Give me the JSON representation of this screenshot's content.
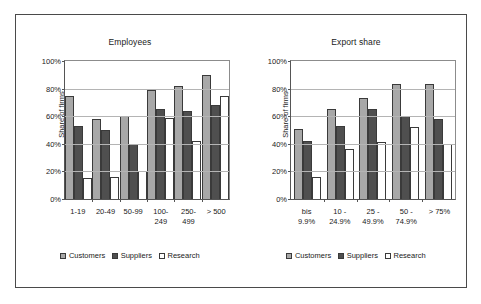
{
  "figure": {
    "ylabel": "Share of firms",
    "legend": [
      {
        "label": "Customers",
        "key": "customers"
      },
      {
        "label": "Suppliers",
        "key": "suppliers"
      },
      {
        "label": "Research",
        "key": "research"
      }
    ],
    "yticks": [
      "0%",
      "20%",
      "40%",
      "60%",
      "80%",
      "100%"
    ],
    "colors": {
      "customers": "#a8a8a8",
      "suppliers": "#4f4f4f",
      "research": "#ffffff",
      "outline": "#3a3a3a",
      "grid": "#b4b4b4",
      "frame": "#4a4a4a"
    }
  },
  "chart_data": [
    {
      "type": "bar",
      "title": "Employees",
      "xlabel": "",
      "ylabel": "Share of firms",
      "ylim": [
        0,
        100
      ],
      "yticks": [
        0,
        20,
        40,
        60,
        80,
        100
      ],
      "grid": true,
      "legend_position": "bottom",
      "categories": [
        "1-19",
        "20-49",
        "50-99",
        "100-249",
        "250-499",
        "> 500"
      ],
      "category_lines": [
        [
          "1-19"
        ],
        [
          "20-49"
        ],
        [
          "50-99"
        ],
        [
          "100-",
          "249"
        ],
        [
          "250-",
          "499"
        ],
        [
          "> 500"
        ]
      ],
      "series": [
        {
          "name": "Customers",
          "values": [
            75,
            58,
            60,
            79,
            82,
            90
          ]
        },
        {
          "name": "Suppliers",
          "values": [
            53,
            50,
            40,
            65,
            64,
            68
          ]
        },
        {
          "name": "Research",
          "values": [
            15,
            16,
            20,
            59,
            42,
            75
          ]
        }
      ]
    },
    {
      "type": "bar",
      "title": "Export share",
      "xlabel": "",
      "ylabel": "Share of firms",
      "ylim": [
        0,
        100
      ],
      "yticks": [
        0,
        20,
        40,
        60,
        80,
        100
      ],
      "grid": true,
      "legend_position": "bottom",
      "categories": [
        "bis 9.9%",
        "10 - 24.9%",
        "25 - 49.9%",
        "50 - 74.9%",
        "> 75%"
      ],
      "category_lines": [
        [
          "bis",
          "9.9%"
        ],
        [
          "10 -",
          "24.9%"
        ],
        [
          "25 -",
          "49.9%"
        ],
        [
          "50 -",
          "74.9%"
        ],
        [
          "> 75%"
        ]
      ],
      "series": [
        {
          "name": "Customers",
          "values": [
            51,
            65,
            73,
            83,
            83
          ]
        },
        {
          "name": "Suppliers",
          "values": [
            42,
            53,
            65,
            60,
            58
          ]
        },
        {
          "name": "Research",
          "values": [
            16,
            36,
            41,
            52,
            40
          ]
        }
      ]
    }
  ]
}
